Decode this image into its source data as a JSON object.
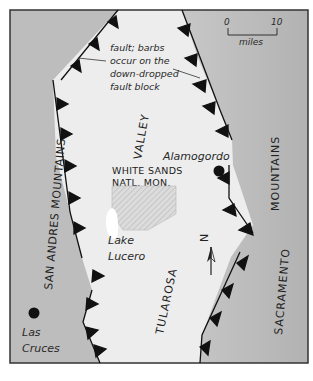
{
  "map": {
    "colors": {
      "mountains": "#b9b9b9",
      "valley": "#ececec",
      "frame": "#333333",
      "fault": "#111111",
      "monument_fill": "#d8d8d8",
      "lake": "#ffffff"
    },
    "labels": {
      "fault_note_1": "fault; barbs",
      "fault_note_2": "occur on the",
      "fault_note_3": "down-dropped",
      "fault_note_4": "fault block",
      "valley": "VALLEY",
      "tularosa": "TULAROSA",
      "san_andres": "SAN ANDRES MOUNTAINS",
      "sacramento": "SACRAMENTO",
      "mountains_right": "MOUNTAINS",
      "white_sands_1": "WHITE SANDS",
      "white_sands_2": "NATL. MON.",
      "alamogordo": "Alamogordo",
      "lake_1": "Lake",
      "lake_2": "Lucero",
      "las_cruces_1": "Las",
      "las_cruces_2": "Cruces",
      "north": "N"
    },
    "scale_bar": {
      "start": "0",
      "end": "10",
      "unit": "miles"
    },
    "legend_icons": [
      "fault-barb-icon",
      "city-dot-icon",
      "north-arrow-icon"
    ]
  }
}
